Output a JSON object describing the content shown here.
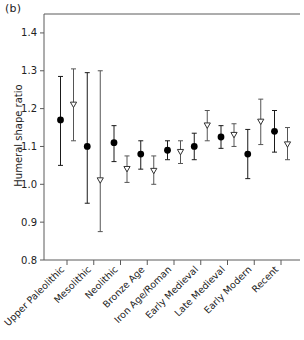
{
  "figure": {
    "panel_label": "(b)",
    "ylabel": "Humeral shape ratio"
  },
  "chart_data": {
    "type": "scatter",
    "title": "",
    "xlabel": "",
    "ylabel": "Humeral shape ratio",
    "ylim": [
      0.8,
      1.45
    ],
    "yticks": [
      0.8,
      0.9,
      1.0,
      1.1,
      1.2,
      1.3,
      1.4
    ],
    "ytick_labels": [
      "0.8",
      "0.9",
      "1.0",
      "1.1",
      "1.2",
      "1.3",
      "1.4"
    ],
    "grid": false,
    "legend": "none",
    "categories": [
      "Upper Paleolithic",
      "Mesolithic",
      "Neolithic",
      "Bronze Age",
      "Iron Age/Roman",
      "Early Medieval",
      "Late Medieval",
      "Early Modern",
      "Recent"
    ],
    "series": [
      {
        "name": "filled-circle",
        "marker": "circle",
        "values": [
          1.17,
          1.1,
          1.11,
          1.08,
          1.09,
          1.1,
          1.125,
          1.08,
          1.14
        ],
        "lower": [
          1.05,
          0.95,
          1.06,
          1.04,
          1.065,
          1.065,
          1.095,
          1.015,
          1.085
        ],
        "upper": [
          1.285,
          1.295,
          1.155,
          1.115,
          1.115,
          1.135,
          1.155,
          1.145,
          1.195
        ]
      },
      {
        "name": "open-triangle",
        "marker": "triangle-down",
        "values": [
          1.21,
          1.01,
          1.04,
          1.035,
          1.085,
          1.155,
          1.13,
          1.165,
          1.105
        ],
        "lower": [
          1.115,
          0.875,
          1.005,
          1.0,
          1.055,
          1.115,
          1.1,
          1.105,
          1.065
        ],
        "upper": [
          1.305,
          1.3,
          1.075,
          1.075,
          1.115,
          1.195,
          1.16,
          1.225,
          1.15
        ]
      }
    ]
  }
}
